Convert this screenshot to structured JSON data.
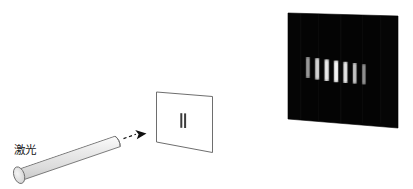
{
  "figure": {
    "background_color": "#ffffff"
  },
  "laser": {
    "label": "激光",
    "body_fill": "#e8e8e8",
    "body_stroke": "#6b6b6b",
    "cap_fill": "#dedede",
    "icon_name": "laser-cylinder"
  },
  "beam": {
    "style": "dashed-arrow",
    "color": "#1a1a1a",
    "icon_name": "beam-arrow"
  },
  "slit_screen": {
    "label": "double-slit-plate",
    "fill": "#ffffff",
    "stroke": "#6b6b6b",
    "slit_count": 2,
    "slit_color": "#3a3a3a"
  },
  "observation_screen": {
    "label": "interference-screen",
    "fill": "#050505",
    "fringe_color": "#f2f2f2",
    "fringe_count": 7,
    "fringes": [
      {
        "index": 1,
        "brightness": 0.62
      },
      {
        "index": 2,
        "brightness": 0.86
      },
      {
        "index": 3,
        "brightness": 0.95
      },
      {
        "index": 4,
        "brightness": 1.0
      },
      {
        "index": 5,
        "brightness": 0.92
      },
      {
        "index": 6,
        "brightness": 0.78
      },
      {
        "index": 7,
        "brightness": 0.58
      }
    ]
  }
}
